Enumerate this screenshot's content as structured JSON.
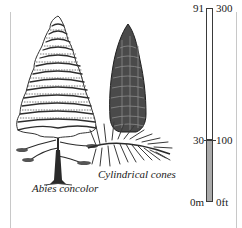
{
  "figure": {
    "species_caption": "Abies concolor",
    "cone_caption": "Cylindrical cones"
  },
  "height_scale": {
    "metric_unit": "m",
    "imperial_unit": "ft",
    "ticks_metric": [
      "91",
      "30",
      "0m"
    ],
    "ticks_imperial": [
      "300",
      "100",
      "0ft"
    ],
    "max_m": 91,
    "max_ft": 300,
    "filled_to_m": 30,
    "filled_to_ft": 100,
    "fill_color": "#aaaaaa",
    "outline_color": "#3a3a3a"
  },
  "icons": {
    "tree": "fir-tree-illustration",
    "cone": "fir-cone-illustration"
  }
}
